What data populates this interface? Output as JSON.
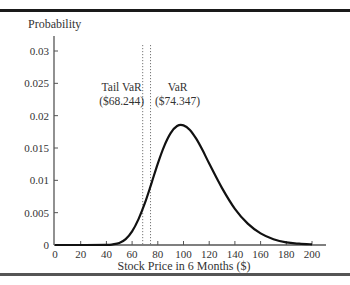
{
  "chart_data": {
    "type": "line",
    "title": "",
    "ylabel": "Probability",
    "xlabel": "Stock Price in 6 Months ($)",
    "xlim": [
      0,
      200
    ],
    "ylim": [
      0,
      0.03
    ],
    "xticks": [
      0,
      20,
      40,
      60,
      80,
      100,
      120,
      140,
      160,
      180,
      200
    ],
    "yticks": [
      0,
      0.005,
      0.01,
      0.015,
      0.02,
      0.025,
      0.03
    ],
    "ytick_labels": [
      "0",
      "0.005",
      "0.01",
      "0.015",
      "0.02",
      "0.025",
      "0.03"
    ],
    "grid": false,
    "legend": null,
    "series": [
      {
        "name": "Stock price distribution",
        "x": [
          0,
          20,
          40,
          45,
          50,
          55,
          60,
          65,
          70,
          75,
          80,
          85,
          90,
          95,
          100,
          105,
          110,
          115,
          120,
          130,
          140,
          150,
          160,
          170,
          180,
          190,
          200
        ],
        "values": [
          0,
          0,
          2e-05,
          0.0001,
          0.0003,
          0.0009,
          0.0021,
          0.004,
          0.0065,
          0.0095,
          0.0126,
          0.0153,
          0.0173,
          0.0184,
          0.0185,
          0.0178,
          0.0164,
          0.0146,
          0.0126,
          0.0088,
          0.0056,
          0.0033,
          0.0018,
          0.0009,
          0.0004,
          0.0002,
          0.0001
        ]
      }
    ],
    "annotations": [
      {
        "type": "vline",
        "x": 68.244,
        "style": "dotted",
        "label_line1": "Tail VaR",
        "label_line2": "($68.244)"
      },
      {
        "type": "vline",
        "x": 74.347,
        "style": "dotted",
        "label_line1": "VaR",
        "label_line2": "($74.347)"
      }
    ]
  }
}
